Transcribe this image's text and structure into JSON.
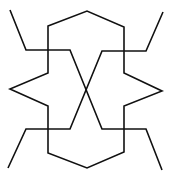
{
  "diagram": {
    "stroke_color": "#111111",
    "background_color": "#ffffff",
    "shapes": [
      {
        "name": "central-polygon",
        "type": "polygon",
        "points": [
          [
            48,
            26
          ],
          [
            87,
            11
          ],
          [
            124,
            27
          ],
          [
            124,
            73
          ],
          [
            162,
            91
          ],
          [
            124,
            106
          ],
          [
            124,
            152
          ],
          [
            87,
            168
          ],
          [
            48,
            153
          ],
          [
            48,
            106
          ],
          [
            10,
            89
          ],
          [
            48,
            73
          ]
        ]
      },
      {
        "name": "arm-top-left-to-bottom-right",
        "type": "polyline",
        "points": [
          [
            10,
            10
          ],
          [
            26,
            50
          ],
          [
            70,
            50
          ],
          [
            102,
            129
          ],
          [
            146,
            129
          ],
          [
            162,
            170
          ]
        ]
      },
      {
        "name": "arm-top-right-to-bottom-left",
        "type": "polyline",
        "points": [
          [
            163,
            12
          ],
          [
            146,
            51
          ],
          [
            102,
            51
          ],
          [
            70,
            129
          ],
          [
            26,
            129
          ],
          [
            8,
            168
          ]
        ]
      }
    ]
  }
}
